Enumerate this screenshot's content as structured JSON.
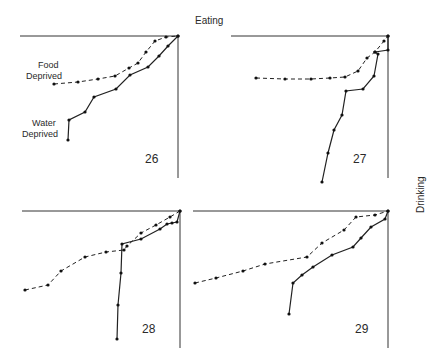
{
  "chart_data": {
    "type": "line",
    "axis_labels": {
      "top": "Eating",
      "right": "Drinking"
    },
    "legend": [
      {
        "name": "Food Deprived",
        "style": "dashed"
      },
      {
        "name": "Water Deprived",
        "style": "solid"
      }
    ],
    "panels": [
      {
        "id": "26",
        "frame": {
          "x1": 20,
          "x2": 178,
          "top": 36,
          "bottom": 178
        },
        "series": [
          {
            "name": "Food Deprived",
            "points": [
              [
                54,
                84
              ],
              [
                78,
                82
              ],
              [
                98,
                79
              ],
              [
                115,
                76
              ],
              [
                129,
                68
              ],
              [
                138,
                63
              ],
              [
                146,
                52
              ],
              [
                155,
                41
              ],
              [
                166,
                37
              ],
              [
                178,
                36
              ]
            ]
          },
          {
            "name": "Water Deprived",
            "points": [
              [
                68,
                140
              ],
              [
                69,
                120
              ],
              [
                85,
                112
              ],
              [
                94,
                97
              ],
              [
                116,
                89
              ],
              [
                130,
                75
              ],
              [
                148,
                67
              ],
              [
                159,
                56
              ],
              [
                168,
                46
              ],
              [
                178,
                36
              ]
            ]
          }
        ]
      },
      {
        "id": "27",
        "frame": {
          "x1": 231,
          "x2": 388,
          "top": 36,
          "bottom": 178
        },
        "series": [
          {
            "name": "Food Deprived",
            "points": [
              [
                256,
                78
              ],
              [
                285,
                79
              ],
              [
                311,
                79
              ],
              [
                330,
                78
              ],
              [
                345,
                77
              ],
              [
                358,
                71
              ],
              [
                367,
                58
              ],
              [
                375,
                52
              ],
              [
                384,
                41
              ],
              [
                388,
                36
              ]
            ]
          },
          {
            "name": "Water Deprived",
            "points": [
              [
                322,
                182
              ],
              [
                328,
                153
              ],
              [
                334,
                130
              ],
              [
                342,
                115
              ],
              [
                346,
                91
              ],
              [
                363,
                89
              ],
              [
                374,
                76
              ],
              [
                378,
                54
              ],
              [
                375,
                52
              ],
              [
                388,
                50
              ],
              [
                388,
                36
              ]
            ]
          }
        ]
      },
      {
        "id": "28",
        "frame": {
          "x1": 22,
          "x2": 180,
          "top": 211,
          "bottom": 348
        },
        "series": [
          {
            "name": "Food Deprived",
            "points": [
              [
                25,
                290
              ],
              [
                48,
                285
              ],
              [
                61,
                271
              ],
              [
                85,
                257
              ],
              [
                106,
                252
              ],
              [
                124,
                250
              ],
              [
                127,
                246
              ],
              [
                141,
                233
              ],
              [
                156,
                225
              ],
              [
                170,
                217
              ],
              [
                180,
                211
              ]
            ]
          },
          {
            "name": "Water Deprived",
            "points": [
              [
                117,
                339
              ],
              [
                118,
                305
              ],
              [
                121,
                273
              ],
              [
                122,
                244
              ],
              [
                141,
                239
              ],
              [
                160,
                229
              ],
              [
                167,
                224
              ],
              [
                172,
                223
              ],
              [
                177,
                222
              ],
              [
                180,
                211
              ]
            ]
          }
        ]
      },
      {
        "id": "29",
        "frame": {
          "x1": 193,
          "x2": 388,
          "top": 211,
          "bottom": 348
        },
        "series": [
          {
            "name": "Food Deprived",
            "points": [
              [
                195,
                283
              ],
              [
                216,
                278
              ],
              [
                243,
                271
              ],
              [
                265,
                264
              ],
              [
                307,
                257
              ],
              [
                322,
                243
              ],
              [
                344,
                230
              ],
              [
                356,
                217
              ],
              [
                375,
                215
              ],
              [
                388,
                211
              ]
            ]
          },
          {
            "name": "Water Deprived",
            "points": [
              [
                289,
                314
              ],
              [
                293,
                283
              ],
              [
                302,
                275
              ],
              [
                313,
                267
              ],
              [
                332,
                255
              ],
              [
                353,
                247
              ],
              [
                361,
                238
              ],
              [
                371,
                227
              ],
              [
                385,
                219
              ],
              [
                388,
                211
              ]
            ]
          }
        ]
      }
    ]
  },
  "labels": {
    "eating": "Eating",
    "drinking": "Drinking",
    "food_deprived_line1": "Food",
    "food_deprived_line2": "Deprived",
    "water_deprived_line1": "Water",
    "water_deprived_line2": "Deprived",
    "panel_26": "26",
    "panel_27": "27",
    "panel_28": "28",
    "panel_29": "29"
  }
}
